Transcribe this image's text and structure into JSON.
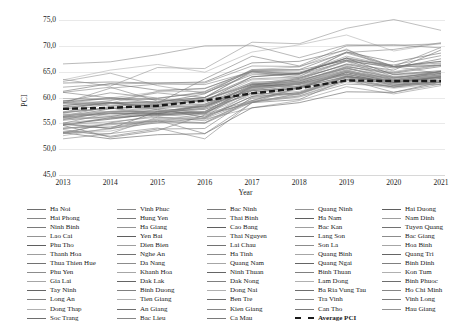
{
  "chart_data": {
    "type": "line",
    "title": "",
    "xlabel": "Year",
    "ylabel": "PCI",
    "x": [
      2013,
      2014,
      2015,
      2016,
      2017,
      2018,
      2019,
      2020,
      2021
    ],
    "xticklabels": [
      "2013",
      "2014",
      "2015",
      "2016",
      "2017",
      "2018",
      "2019",
      "2020",
      "2021"
    ],
    "yticklabels": [
      "75,0",
      "70,0",
      "65,0",
      "60,0",
      "55,0",
      "50,0",
      "45,0"
    ],
    "ylim": [
      45.0,
      75.0
    ],
    "ytick_values": [
      75.0,
      70.0,
      65.0,
      60.0,
      55.0,
      50.0,
      45.0
    ],
    "grid": true,
    "legend_position": "below",
    "average_series": {
      "name": "Average PCI",
      "style": "bold-dashed",
      "color": "#1a1a1a",
      "values": [
        57.8,
        58.0,
        58.4,
        59.4,
        60.8,
        61.8,
        63.3,
        63.2,
        63.2
      ]
    },
    "series": [
      {
        "name": "Ha Noi",
        "values": [
          57.7,
          59.0,
          59.0,
          60.7,
          65.4,
          65.4,
          68.8,
          66.9,
          68.6
        ]
      },
      {
        "name": "Hai Phong",
        "values": [
          56.4,
          58.3,
          58.7,
          60.0,
          65.1,
          64.5,
          68.7,
          69.3,
          70.6
        ]
      },
      {
        "name": "Ninh Binh",
        "values": [
          56.8,
          56.6,
          56.9,
          58.0,
          62.2,
          62.5,
          64.3,
          62.3,
          64.1
        ]
      },
      {
        "name": "Lao Cai",
        "values": [
          63.1,
          64.7,
          62.3,
          60.8,
          64.7,
          64.6,
          68.0,
          66.0,
          64.6
        ]
      },
      {
        "name": "Phu Tho",
        "values": [
          56.3,
          57.8,
          58.5,
          59.5,
          62.6,
          62.0,
          65.0,
          63.7,
          65.0
        ]
      },
      {
        "name": "Thanh Hoa",
        "values": [
          56.6,
          57.0,
          58.0,
          56.1,
          62.5,
          63.9,
          66.2,
          63.9,
          64.7
        ]
      },
      {
        "name": "Thua Thien Hue",
        "values": [
          59.0,
          60.0,
          59.0,
          59.7,
          62.4,
          63.5,
          66.5,
          65.3,
          69.2
        ]
      },
      {
        "name": "Phu Yen",
        "values": [
          53.3,
          53.0,
          56.2,
          55.5,
          59.2,
          60.3,
          63.3,
          62.0,
          63.7
        ]
      },
      {
        "name": "Gia Lai",
        "values": [
          56.0,
          56.3,
          56.8,
          56.0,
          60.9,
          61.8,
          65.3,
          63.4,
          64.4
        ]
      },
      {
        "name": "Tay Ninh",
        "values": [
          57.1,
          58.0,
          56.7,
          57.2,
          62.1,
          62.9,
          65.1,
          62.9,
          63.3
        ]
      },
      {
        "name": "Long An",
        "values": [
          58.4,
          59.4,
          60.9,
          60.0,
          63.6,
          64.0,
          68.8,
          66.0,
          66.7
        ]
      },
      {
        "name": "Dong Thap",
        "values": [
          63.4,
          65.3,
          66.4,
          64.9,
          68.8,
          70.2,
          72.1,
          69.0,
          70.5
        ]
      },
      {
        "name": "Soc Trang",
        "values": [
          55.6,
          56.3,
          57.7,
          56.2,
          60.2,
          62.0,
          64.1,
          62.6,
          63.0
        ]
      },
      {
        "name": "Vinh Phuc",
        "values": [
          58.9,
          61.8,
          62.6,
          62.5,
          65.0,
          64.6,
          67.7,
          66.0,
          69.7
        ]
      },
      {
        "name": "Hung Yen",
        "values": [
          53.0,
          55.1,
          56.5,
          56.8,
          59.4,
          62.0,
          64.8,
          63.0,
          65.1
        ]
      },
      {
        "name": "Ha Giang",
        "values": [
          53.0,
          53.9,
          55.9,
          55.8,
          58.0,
          59.4,
          62.1,
          60.7,
          62.3
        ]
      },
      {
        "name": "Yen Bai",
        "values": [
          55.0,
          54.0,
          57.3,
          57.7,
          60.8,
          60.6,
          64.0,
          63.3,
          64.4
        ]
      },
      {
        "name": "Dien Bien",
        "values": [
          53.4,
          53.5,
          55.4,
          56.4,
          59.2,
          60.6,
          63.5,
          62.3,
          63.4
        ]
      },
      {
        "name": "Nghe An",
        "values": [
          57.2,
          58.8,
          58.3,
          58.7,
          62.7,
          62.8,
          65.7,
          63.9,
          64.7
        ]
      },
      {
        "name": "Da Nang",
        "values": [
          66.5,
          66.9,
          68.3,
          70.0,
          70.1,
          67.7,
          70.2,
          70.1,
          70.4
        ]
      },
      {
        "name": "Khanh Hoa",
        "values": [
          59.8,
          59.8,
          58.7,
          59.3,
          63.4,
          63.7,
          67.0,
          63.3,
          64.8
        ]
      },
      {
        "name": "Dak Lak",
        "values": [
          56.2,
          57.0,
          56.8,
          58.4,
          61.4,
          61.7,
          64.9,
          63.0,
          63.7
        ]
      },
      {
        "name": "Binh Duong",
        "values": [
          58.2,
          58.8,
          58.9,
          63.6,
          68.0,
          66.1,
          70.0,
          70.2,
          69.6
        ]
      },
      {
        "name": "Tien Giang",
        "values": [
          57.2,
          58.0,
          56.3,
          57.9,
          61.7,
          62.6,
          65.4,
          63.0,
          63.9
        ]
      },
      {
        "name": "An Giang",
        "values": [
          59.1,
          59.1,
          57.6,
          56.8,
          62.2,
          63.7,
          66.4,
          64.7,
          66.0
        ]
      },
      {
        "name": "Bac Lieu",
        "values": [
          52.0,
          53.0,
          54.1,
          52.0,
          59.0,
          62.0,
          64.6,
          62.6,
          62.5
        ]
      },
      {
        "name": "Bac Ninh",
        "values": [
          59.2,
          60.9,
          59.9,
          60.9,
          64.4,
          64.5,
          67.0,
          66.0,
          67.0
        ]
      },
      {
        "name": "Thai Binh",
        "values": [
          55.1,
          55.9,
          56.9,
          57.1,
          61.8,
          63.0,
          65.9,
          64.8,
          66.4
        ]
      },
      {
        "name": "Cao Bang",
        "values": [
          53.2,
          52.0,
          52.8,
          53.0,
          58.0,
          59.0,
          61.1,
          61.0,
          63.0
        ]
      },
      {
        "name": "Thai Nguyen",
        "values": [
          58.9,
          58.9,
          61.2,
          61.8,
          64.9,
          64.2,
          67.0,
          64.9,
          66.2
        ]
      },
      {
        "name": "Lai Chau",
        "values": [
          54.6,
          52.3,
          53.6,
          56.6,
          59.0,
          59.6,
          63.5,
          62.0,
          63.0
        ]
      },
      {
        "name": "Ha Tinh",
        "values": [
          56.3,
          57.3,
          57.2,
          58.5,
          62.2,
          63.0,
          65.3,
          63.0,
          64.1
        ]
      },
      {
        "name": "Quang Nam",
        "values": [
          58.8,
          59.9,
          61.1,
          61.2,
          65.4,
          65.9,
          69.4,
          65.0,
          66.6
        ]
      },
      {
        "name": "Ninh Thuan",
        "values": [
          56.1,
          56.9,
          57.0,
          58.5,
          62.0,
          62.8,
          64.5,
          62.9,
          64.1
        ]
      },
      {
        "name": "Dak Nong",
        "values": [
          54.1,
          54.3,
          55.6,
          53.0,
          59.0,
          60.8,
          63.5,
          61.0,
          62.6
        ]
      },
      {
        "name": "Dong Nai",
        "values": [
          57.9,
          57.1,
          58.3,
          59.0,
          63.0,
          63.0,
          65.6,
          64.1,
          65.0
        ]
      },
      {
        "name": "Ben Tre",
        "values": [
          62.8,
          63.0,
          62.8,
          63.0,
          66.7,
          67.0,
          69.2,
          66.0,
          67.0
        ]
      },
      {
        "name": "Kien Giang",
        "values": [
          61.0,
          62.0,
          59.3,
          60.0,
          65.0,
          63.8,
          67.2,
          64.0,
          63.8
        ]
      },
      {
        "name": "Ca Mau",
        "values": [
          53.8,
          52.5,
          53.9,
          54.0,
          60.0,
          61.0,
          64.2,
          62.4,
          63.0
        ]
      },
      {
        "name": "Quang Ninh",
        "values": [
          63.5,
          62.2,
          65.8,
          65.6,
          70.7,
          70.4,
          73.4,
          75.1,
          73.0
        ]
      },
      {
        "name": "Ha Nam",
        "values": [
          54.6,
          56.1,
          56.6,
          57.0,
          61.3,
          62.2,
          65.1,
          63.5,
          64.6
        ]
      },
      {
        "name": "Bac Kan",
        "values": [
          54.0,
          54.7,
          55.7,
          55.1,
          59.4,
          60.3,
          63.0,
          61.8,
          62.7
        ]
      },
      {
        "name": "Lang Son",
        "values": [
          54.8,
          54.0,
          55.1,
          56.0,
          60.2,
          60.9,
          64.0,
          63.3,
          63.9
        ]
      },
      {
        "name": "Son La",
        "values": [
          54.0,
          54.9,
          55.1,
          55.1,
          59.8,
          60.8,
          63.9,
          62.0,
          63.0
        ]
      },
      {
        "name": "Quang Binh",
        "values": [
          56.6,
          57.3,
          58.1,
          58.4,
          62.0,
          62.2,
          65.0,
          63.9,
          64.0
        ]
      },
      {
        "name": "Quang Ngai",
        "values": [
          58.5,
          59.0,
          58.2,
          58.2,
          61.5,
          62.6,
          64.9,
          62.9,
          64.2
        ]
      },
      {
        "name": "Binh Thuan",
        "values": [
          59.0,
          58.4,
          58.7,
          59.5,
          62.9,
          63.4,
          65.6,
          63.8,
          65.0
        ]
      },
      {
        "name": "Lam Dong",
        "values": [
          56.0,
          57.0,
          57.9,
          58.5,
          62.9,
          62.6,
          65.2,
          63.4,
          64.3
        ]
      },
      {
        "name": "Ba Ria Vung Tau",
        "values": [
          58.0,
          59.0,
          59.2,
          60.0,
          64.0,
          64.6,
          67.6,
          65.9,
          66.2
        ]
      },
      {
        "name": "Tra Vinh",
        "values": [
          55.0,
          57.0,
          57.1,
          58.7,
          62.2,
          63.2,
          65.8,
          63.2,
          64.3
        ]
      },
      {
        "name": "Can Tho",
        "values": [
          61.0,
          59.9,
          59.8,
          61.1,
          65.1,
          64.9,
          67.3,
          66.3,
          68.1
        ]
      },
      {
        "name": "Hai Duong",
        "values": [
          56.0,
          56.0,
          57.2,
          57.9,
          61.6,
          62.6,
          65.0,
          63.2,
          64.0
        ]
      },
      {
        "name": "Nam Dinh",
        "values": [
          54.8,
          55.8,
          56.9,
          57.3,
          61.9,
          62.6,
          64.5,
          62.8,
          64.0
        ]
      },
      {
        "name": "Tuyen Quang",
        "values": [
          52.6,
          54.1,
          55.4,
          56.9,
          60.5,
          61.2,
          63.8,
          63.1,
          64.2
        ]
      },
      {
        "name": "Bac Giang",
        "values": [
          55.7,
          57.3,
          57.3,
          58.2,
          62.5,
          63.2,
          66.0,
          64.5,
          65.2
        ]
      },
      {
        "name": "Hoa Binh",
        "values": [
          54.8,
          55.3,
          56.2,
          55.9,
          59.4,
          61.7,
          63.8,
          62.8,
          63.9
        ]
      },
      {
        "name": "Quang Tri",
        "values": [
          56.6,
          57.3,
          57.5,
          57.3,
          61.8,
          62.6,
          64.5,
          63.1,
          63.3
        ]
      },
      {
        "name": "Binh Dinh",
        "values": [
          59.4,
          59.7,
          59.6,
          59.3,
          64.0,
          64.7,
          67.6,
          64.4,
          65.0
        ]
      },
      {
        "name": "Kon Tum",
        "values": [
          53.2,
          55.0,
          55.4,
          55.0,
          59.1,
          60.1,
          62.6,
          62.2,
          63.2
        ]
      },
      {
        "name": "Binh Phuoc",
        "values": [
          55.0,
          54.8,
          55.8,
          56.0,
          60.9,
          62.3,
          65.0,
          62.7,
          63.4
        ]
      },
      {
        "name": "Ho Chi Minh",
        "values": [
          61.2,
          62.7,
          61.4,
          61.7,
          65.2,
          65.3,
          67.2,
          65.7,
          67.5
        ]
      },
      {
        "name": "Vinh Long",
        "values": [
          62.0,
          62.6,
          62.8,
          62.8,
          66.1,
          66.0,
          68.6,
          66.0,
          66.2
        ]
      },
      {
        "name": "Hau Giang",
        "values": [
          57.0,
          58.0,
          58.0,
          57.0,
          61.0,
          62.0,
          64.0,
          63.0,
          64.0
        ]
      }
    ]
  },
  "legend": {
    "columns": [
      {
        "items": [
          {
            "label": "Ha Noi"
          },
          {
            "label": "Hai Phong"
          },
          {
            "label": "Ninh Binh"
          },
          {
            "label": "Lao Cai"
          },
          {
            "label": "Phu Tho"
          },
          {
            "label": "Thanh Hoa"
          },
          {
            "label": "Thua Thien Hue"
          },
          {
            "label": "Phu Yen"
          },
          {
            "label": "Gia Lai"
          },
          {
            "label": "Tay Ninh"
          },
          {
            "label": "Long An"
          },
          {
            "label": "Dong Thap"
          },
          {
            "label": "Soc Trang"
          }
        ]
      },
      {
        "items": [
          {
            "label": "Vinh Phuc"
          },
          {
            "label": "Hung Yen"
          },
          {
            "label": "Ha Giang"
          },
          {
            "label": "Yen Bai"
          },
          {
            "label": "Dien Bien"
          },
          {
            "label": "Nghe An"
          },
          {
            "label": "Da Nang"
          },
          {
            "label": "Khanh Hoa"
          },
          {
            "label": "Dak Lak"
          },
          {
            "label": "Binh Duong"
          },
          {
            "label": "Tien Giang"
          },
          {
            "label": "An Giang"
          },
          {
            "label": "Bac Lieu"
          }
        ]
      },
      {
        "items": [
          {
            "label": "Bac Ninh"
          },
          {
            "label": "Thai Binh"
          },
          {
            "label": "Cao Bang"
          },
          {
            "label": "Thai Nguyen"
          },
          {
            "label": "Lai Chau"
          },
          {
            "label": "Ha Tinh"
          },
          {
            "label": "Quang Nam"
          },
          {
            "label": "Ninh Thuan"
          },
          {
            "label": "Dak Nong"
          },
          {
            "label": "Dong Nai"
          },
          {
            "label": "Ben Tre"
          },
          {
            "label": "Kien Giang"
          },
          {
            "label": "Ca Mau"
          }
        ]
      },
      {
        "items": [
          {
            "label": "Quang Ninh"
          },
          {
            "label": "Ha Nam"
          },
          {
            "label": "Bac Kan"
          },
          {
            "label": "Lang Son"
          },
          {
            "label": "Son La"
          },
          {
            "label": "Quang Binh"
          },
          {
            "label": "Quang Ngai"
          },
          {
            "label": "Binh Thuan"
          },
          {
            "label": "Lam Dong"
          },
          {
            "label": "Ba Ria Vung Tau"
          },
          {
            "label": "Tra Vinh"
          },
          {
            "label": "Can Tho"
          },
          {
            "label": "Average PCI",
            "dashed": true
          }
        ]
      },
      {
        "items": [
          {
            "label": "Hai Duong"
          },
          {
            "label": "Nam Dinh"
          },
          {
            "label": "Tuyen Quang"
          },
          {
            "label": "Bac Giang"
          },
          {
            "label": "Hoa Binh"
          },
          {
            "label": "Quang Tri"
          },
          {
            "label": "Binh Dinh"
          },
          {
            "label": "Kon Tum"
          },
          {
            "label": "Binh Phuoc"
          },
          {
            "label": "Ho Chi Minh"
          },
          {
            "label": "Vinh Long"
          },
          {
            "label": "Hau Giang"
          }
        ]
      }
    ]
  }
}
